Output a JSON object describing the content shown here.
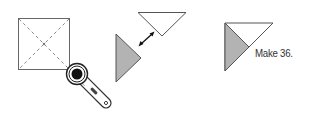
{
  "diagram": {
    "steps": [
      {
        "name": "cut-square-diagonally",
        "shape": "square-with-dashed-diagonals",
        "tool": "rotary-cutter-icon"
      },
      {
        "name": "separate-triangles",
        "shapes": [
          "white-triangle",
          "gray-triangle"
        ],
        "connector": "double-headed-arrow"
      },
      {
        "name": "result-unit",
        "shapes": [
          "white-triangle",
          "gray-triangle"
        ],
        "caption": "Make 36."
      }
    ],
    "colors": {
      "stroke": "#555555",
      "gray_fill": "#b3b3b3",
      "white_fill": "#ffffff",
      "text": "#333333"
    }
  }
}
